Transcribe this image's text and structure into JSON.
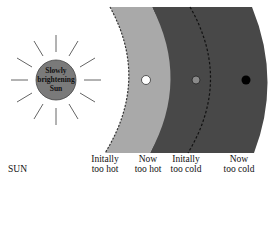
{
  "sun": {
    "line1": "Slowly",
    "line2": "brightening",
    "line3": "Sun",
    "fill": "#7a7a7a"
  },
  "zones": {
    "hot_band_color": "#a9a9a9",
    "cold_band_color": "#484848",
    "boundaries": [
      "dashed: initial inner edge",
      "solid: current light/dark boundary",
      "dashed: initial outer boundary"
    ]
  },
  "planets": [
    {
      "position": "inner",
      "color": "#ffffff"
    },
    {
      "position": "middle",
      "color": "#8a8a8a"
    },
    {
      "position": "outer",
      "color": "#000000"
    }
  ],
  "labels": {
    "sun": "SUN",
    "initially_too_hot": [
      "Initally",
      "too hot"
    ],
    "now_too_hot": [
      "Now",
      "too hot"
    ],
    "initially_too_cold": [
      "Initally",
      "too cold"
    ],
    "now_too_cold": [
      "Now",
      "too cold"
    ]
  }
}
